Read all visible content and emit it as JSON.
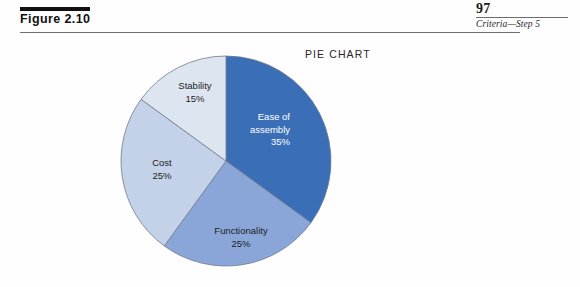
{
  "figure": {
    "label": "Figure 2.10"
  },
  "folio": {
    "page_number": "97",
    "running_head": "Criteria—Step 5"
  },
  "chart_data": {
    "type": "pie",
    "title": "PIE CHART",
    "xlabel": "",
    "ylabel": "",
    "start_angle_deg": 0,
    "direction": "clockwise",
    "legend": "none",
    "grid": false,
    "categories": [
      "Ease of assembly",
      "Functionality",
      "Cost",
      "Stability"
    ],
    "values": [
      35,
      25,
      25,
      15
    ],
    "unit": "%",
    "colors": [
      "#3a6fb8",
      "#8aa6d8",
      "#c3d2e8",
      "#dde5f1"
    ],
    "slices": [
      {
        "name": "Ease of assembly",
        "value": 35,
        "value_label": "35%",
        "label_lines": [
          "Ease of",
          "assembly",
          "35%"
        ],
        "color": "#3a6fb8",
        "text_color": "#ffffff",
        "text_anchor": "end"
      },
      {
        "name": "Functionality",
        "value": 25,
        "value_label": "25%",
        "label_lines": [
          "Functionality",
          "25%"
        ],
        "color": "#8aa6d8",
        "text_color": "#1d1d1d",
        "text_anchor": "middle"
      },
      {
        "name": "Cost",
        "value": 25,
        "value_label": "25%",
        "label_lines": [
          "Cost",
          "25%"
        ],
        "color": "#c3d2e8",
        "text_color": "#1d1d1d",
        "text_anchor": "middle"
      },
      {
        "name": "Stability",
        "value": 15,
        "value_label": "15%",
        "label_lines": [
          "Stability",
          "15%"
        ],
        "color": "#dde5f1",
        "text_color": "#1d1d1d",
        "text_anchor": "middle"
      }
    ]
  }
}
